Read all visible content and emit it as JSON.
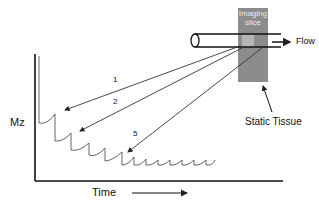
{
  "labels": {
    "y_axis": "Mz",
    "x_axis": "Time",
    "imaging_slice_line1": "Imaging",
    "imaging_slice_line2": "slice",
    "flow": "Flow",
    "static_tissue": "Static Tissue",
    "arrow_1": "1",
    "arrow_2": "2",
    "arrow_5": "5"
  },
  "colors": {
    "slice": "#8c8c8c",
    "slice_highlight": "#b5b5b5",
    "line": "#222222",
    "curve": "#555555"
  }
}
